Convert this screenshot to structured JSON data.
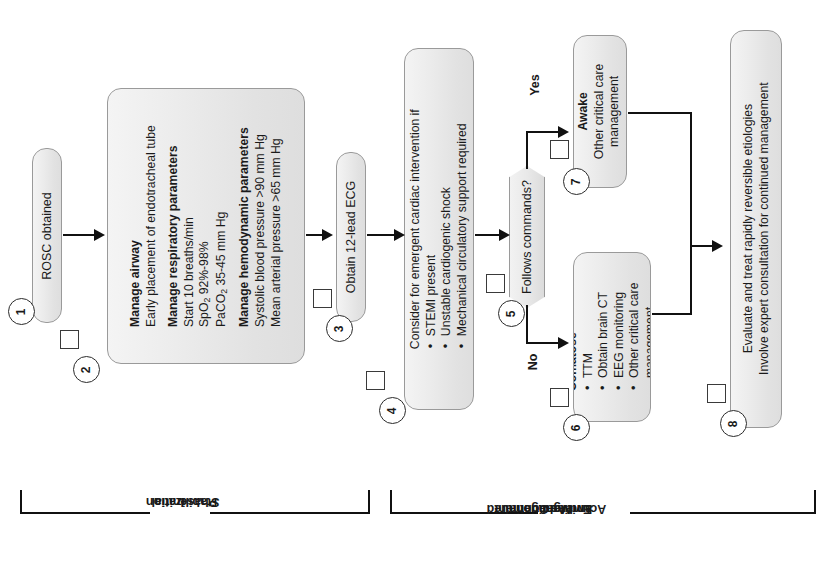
{
  "diagram": {
    "orientation": "rotated-90-ccw",
    "colors": {
      "box_fill": "#e8e8e8",
      "box_border": "#9a9a9a",
      "line": "#111111",
      "background": "#ffffff"
    }
  },
  "nodes": [
    {
      "number": "1",
      "name": "rosc-obtained",
      "lines": [
        {
          "text": "ROSC obtained",
          "bold": false
        }
      ]
    },
    {
      "number": "2",
      "name": "manage-airway-respiratory-hemodynamic",
      "lines": [
        {
          "text": "Manage airway",
          "bold": true
        },
        {
          "text": "Early placement of endotracheal tube",
          "bold": false
        },
        {
          "text": "Manage respiratory parameters",
          "bold": true
        },
        {
          "text": "Start 10 breaths/min",
          "bold": false
        },
        {
          "text": "SpO2 92%-98%",
          "bold": false
        },
        {
          "text": "PaCO2 35-45 mm Hg",
          "bold": false
        },
        {
          "text": "Manage hemodynamic parameters",
          "bold": true
        },
        {
          "text": "Systolic blood pressure >90 mm Hg",
          "bold": false
        },
        {
          "text": "Mean arterial pressure >65 mm Hg",
          "bold": false
        }
      ]
    },
    {
      "number": "3",
      "name": "obtain-12-lead-ecg",
      "lines": [
        {
          "text": "Obtain 12-lead ECG",
          "bold": false
        }
      ]
    },
    {
      "number": "4",
      "name": "consider-emergent-cardiac-intervention",
      "lines": [
        {
          "text": "Consider for emergent cardiac intervention if",
          "bold": false
        },
        {
          "text": "STEMI present",
          "bold": false,
          "bullet": true
        },
        {
          "text": "Unstable cardiogenic shock",
          "bold": false,
          "bullet": true
        },
        {
          "text": "Mechanical circulatory support required",
          "bold": false,
          "bullet": true
        }
      ]
    },
    {
      "number": "5",
      "name": "follows-commands-decision",
      "shape": "decision",
      "lines": [
        {
          "text": "Follows commands?",
          "bold": false
        }
      ]
    },
    {
      "number": "6",
      "name": "comatose-management",
      "lines": [
        {
          "text": "Comatose",
          "bold": true
        },
        {
          "text": "TTM",
          "bold": false,
          "bullet": true
        },
        {
          "text": "Obtain brain CT",
          "bold": false,
          "bullet": true
        },
        {
          "text": "EEG monitoring",
          "bold": false,
          "bullet": true
        },
        {
          "text": "Other critical care management",
          "bold": false,
          "bullet": true
        }
      ]
    },
    {
      "number": "7",
      "name": "awake-management",
      "lines": [
        {
          "text": "Awake",
          "bold": true
        },
        {
          "text": "Other critical care management",
          "bold": false
        }
      ]
    },
    {
      "number": "8",
      "name": "evaluate-treat-reversible-etiologies",
      "lines": [
        {
          "text": "Evaluate and treat rapidly reversible etiologies",
          "bold": false
        },
        {
          "text": "Involve expert consultation for continued management",
          "bold": false
        }
      ]
    }
  ],
  "branch_labels": {
    "yes": "Yes",
    "no": "No"
  },
  "phases": [
    {
      "name": "initial-stabilization-phase",
      "label_lines": [
        "Initial",
        "Stabilization",
        "Phase"
      ]
    },
    {
      "name": "continued-management-phase",
      "label_lines": [
        "Continued",
        "Management",
        "and Additional",
        "Emergent",
        "Activities"
      ]
    }
  ],
  "node_text": {
    "n1_l1": "ROSC obtained",
    "n2_l1": "Manage airway",
    "n2_l2": "Early placement of endotracheal tube",
    "n2_l3": "Manage respiratory parameters",
    "n2_l4": "Start 10 breaths/min",
    "n2_l5a": "SpO",
    "n2_l5b": "2",
    "n2_l5c": " 92%-98%",
    "n2_l6a": "PaCO",
    "n2_l6b": "2",
    "n2_l6c": " 35-45 mm Hg",
    "n2_l7": "Manage hemodynamic parameters",
    "n2_l8": "Systolic blood pressure >90 mm Hg",
    "n2_l9": "Mean arterial pressure >65 mm Hg",
    "n3_l1": "Obtain 12-lead ECG",
    "n4_l1": "Consider for emergent cardiac intervention if",
    "n4_l2": "STEMI present",
    "n4_l3": "Unstable cardiogenic shock",
    "n4_l4": "Mechanical circulatory support required",
    "n5_l1": "Follows commands?",
    "n6_l1": "Comatose",
    "n6_l2": "TTM",
    "n6_l3": "Obtain brain CT",
    "n6_l4": "EEG monitoring",
    "n6_l5": "Other critical care",
    "n6_l6": "management",
    "n7_l1": "Awake",
    "n7_l2": "Other critical care",
    "n7_l3": "management",
    "n8_l1": "Evaluate and treat rapidly reversible etiologies",
    "n8_l2": "Involve expert consultation for continued management"
  },
  "numbers": {
    "n1": "1",
    "n2": "2",
    "n3": "3",
    "n4": "4",
    "n5": "5",
    "n6": "6",
    "n7": "7",
    "n8": "8"
  },
  "phase_text": {
    "p1_1": "Initial",
    "p1_2": "Stabilization",
    "p1_3": "Phase",
    "p2_1": "Continued",
    "p2_2": "Management",
    "p2_3": "and Additional",
    "p2_4": "Emergent",
    "p2_5": "Activities"
  }
}
